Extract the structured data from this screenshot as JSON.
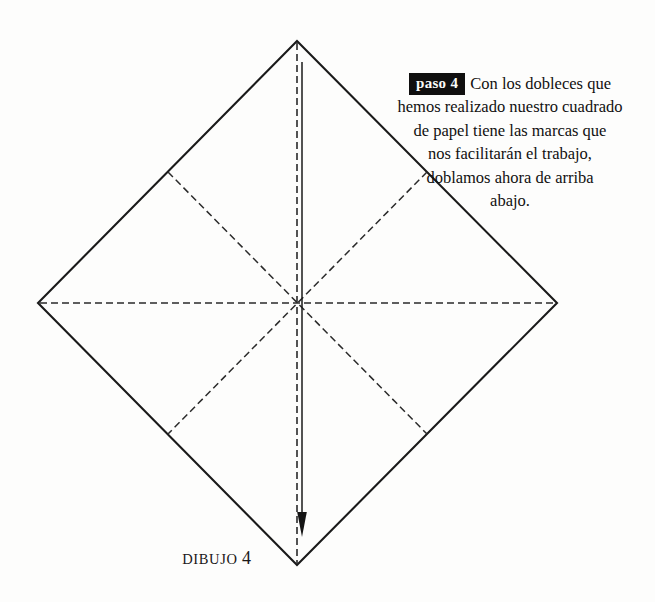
{
  "page": {
    "background_color": "#fdfdfc",
    "width": 655,
    "height": 602
  },
  "instruction": {
    "step_badge": "paso 4",
    "badge_background": "#100f0f",
    "badge_text_color": "#fbfbfa",
    "lines": [
      "Con los dobleces que",
      "hemos realizado nuestro cuadrado",
      "de papel tiene las marcas que",
      "nos facilitarán el trabajo,",
      "doblamos ahora de arriba",
      "abajo."
    ],
    "full_text": "Con los dobleces que hemos realizado nuestro cuadrado de papel tiene las marcas que nos facilitarán el trabajo, doblamos ahora de arriba abajo.",
    "text_color": "#111010",
    "alignment": "center"
  },
  "caption": {
    "word": "DIBUJO",
    "number": "4",
    "color": "#1a1818"
  },
  "diagram": {
    "name": "origami-square-fold-diagram",
    "stroke_color": "#1a1a1a",
    "solid_stroke_width": 2,
    "dashed_stroke_width": 1.6,
    "dash_pattern": "7,4",
    "vertices": {
      "top": [
        297,
        41
      ],
      "right": [
        557,
        303
      ],
      "bottom": [
        297,
        565
      ],
      "left": [
        38,
        303
      ]
    },
    "edge_midpoints": {
      "upper_left": [
        168,
        172
      ],
      "upper_right": [
        427,
        172
      ],
      "lower_left": [
        168,
        434
      ],
      "lower_right": [
        427,
        434
      ]
    },
    "center": [
      297,
      303
    ],
    "crease_lines": [
      {
        "name": "horizontal-crease",
        "from": [
          38,
          303
        ],
        "to": [
          557,
          303
        ],
        "style": "dashed"
      },
      {
        "name": "vertical-crease",
        "from": [
          297,
          41
        ],
        "to": [
          297,
          565
        ],
        "style": "dashed"
      },
      {
        "name": "diagonal-crease-nw-se",
        "from": [
          168,
          172
        ],
        "to": [
          427,
          434
        ],
        "style": "dashed"
      },
      {
        "name": "diagonal-crease-ne-sw",
        "from": [
          427,
          172
        ],
        "to": [
          168,
          434
        ],
        "style": "dashed"
      }
    ],
    "fold_arrow": {
      "name": "fold-direction-arrow",
      "from": [
        302,
        62
      ],
      "to": [
        302,
        537
      ],
      "direction": "down",
      "style": "solid-with-arrowhead"
    }
  }
}
